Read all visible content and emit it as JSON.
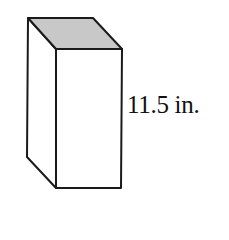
{
  "figure": {
    "shape": "rectangular prism",
    "top_face_fill": "#c8c8c8",
    "face_fill": "#ffffff",
    "stroke_color": "#1a1a1a",
    "height_label": "11.5 in."
  }
}
